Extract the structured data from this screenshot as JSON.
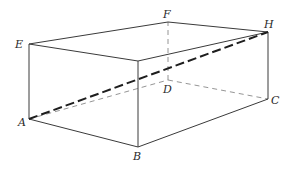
{
  "diagram": {
    "type": "rectangular-prism",
    "vertices": {
      "A": {
        "label": "A",
        "x": 29,
        "y": 119
      },
      "B": {
        "label": "B",
        "x": 138,
        "y": 147
      },
      "C": {
        "label": "C",
        "x": 268,
        "y": 99
      },
      "D": {
        "label": "D",
        "x": 168,
        "y": 80
      },
      "E": {
        "label": "E",
        "x": 29,
        "y": 44
      },
      "F": {
        "label": "F",
        "x": 168,
        "y": 22
      },
      "G": {
        "label": "",
        "x": 138,
        "y": 61
      },
      "H": {
        "label": "H",
        "x": 268,
        "y": 32
      }
    },
    "labels": {
      "A": "A",
      "B": "B",
      "C": "C",
      "D": "D",
      "E": "E",
      "F": "F",
      "H": "H"
    },
    "edges_visible": [
      "A-B",
      "B-C",
      "A-E",
      "B-G",
      "C-H",
      "E-G",
      "E-F",
      "F-H",
      "G-H"
    ],
    "edges_hidden": [
      "A-D",
      "D-C",
      "D-F"
    ],
    "highlighted_diagonal": "A-H",
    "colors": {
      "solid_edge": "#3a3a3a",
      "hidden_edge": "#7a7a7a",
      "diagonal": "#1e1e1e",
      "label": "#2a2a2a",
      "background": "#ffffff"
    }
  }
}
